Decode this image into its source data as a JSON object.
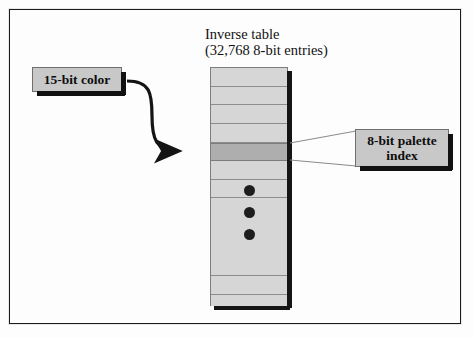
{
  "figure": {
    "title_lines": "Inverse table\n(32,768 8-bit entries)",
    "background_color": "#fdfdfd",
    "frame_color": "#1a1a1a"
  },
  "table": {
    "name": "inverse-table",
    "entry_count": "32,768",
    "entry_width": "8-bit",
    "row_fill_color": "#d6d6d6",
    "row_line_color": "#8d8d8d",
    "highlight_fill_color": "#aeaeae",
    "shadow_color": "#151515",
    "rows": [
      {
        "index": 0,
        "top": 1,
        "height": 18,
        "highlight": false,
        "gap": false
      },
      {
        "index": 1,
        "top": 19,
        "height": 18,
        "highlight": false,
        "gap": false
      },
      {
        "index": 2,
        "top": 37,
        "height": 19,
        "highlight": false,
        "gap": false
      },
      {
        "index": 3,
        "top": 56,
        "height": 19,
        "highlight": false,
        "gap": false
      },
      {
        "index": 4,
        "top": 75,
        "height": 18,
        "highlight": true,
        "gap": false
      },
      {
        "index": 5,
        "top": 93,
        "height": 19,
        "highlight": false,
        "gap": false
      },
      {
        "index": 6,
        "top": 112,
        "height": 18,
        "highlight": false,
        "gap": false
      },
      {
        "index": 7,
        "top": 130,
        "height": 60,
        "highlight": false,
        "gap": true
      },
      {
        "index": 8,
        "top": 190,
        "height": 18,
        "highlight": false,
        "gap": false
      },
      {
        "index": 9,
        "top": 208,
        "height": 19,
        "highlight": false,
        "gap": false
      },
      {
        "index": 10,
        "top": 227,
        "height": 11,
        "highlight": false,
        "gap": true
      }
    ],
    "ellipsis": {
      "name": "vertical-ellipsis",
      "dot_color": "#1d1d1d",
      "dots": [
        {
          "left": 244,
          "top": 185
        },
        {
          "left": 244,
          "top": 207
        },
        {
          "left": 244,
          "top": 229
        }
      ]
    }
  },
  "callouts": {
    "input": {
      "label": "15-bit color",
      "fill_color": "#c8c8c8",
      "border_color": "#6f6f6f",
      "shadow_color": "#111111"
    },
    "output": {
      "label": "8-bit palette\nindex",
      "fill_color": "#c8c8c8",
      "border_color": "#6f6f6f",
      "shadow_color": "#111111"
    }
  },
  "connectors": {
    "arrow": {
      "name": "lookup-arrow",
      "color": "#141414",
      "path": "M 127 81 C 150 81, 152 93, 152 116 C 152 139, 156 151, 178 151",
      "description": "S-curve from 15-bit color box to highlighted table row"
    },
    "leader_top": {
      "name": "leader-line-top",
      "color": "#8a8a8a",
      "path": "M 290 143 L 356 131"
    },
    "leader_bottom": {
      "name": "leader-line-bottom",
      "color": "#8a8a8a",
      "path": "M 290 160 L 356 166"
    }
  }
}
